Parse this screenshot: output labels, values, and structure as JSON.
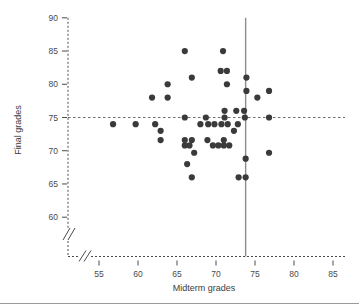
{
  "chart_data": {
    "type": "scatter",
    "title": "",
    "xlabel": "Midterm grades",
    "ylabel": "Final grades",
    "xlim": [
      52,
      87
    ],
    "ylim": [
      57.5,
      91
    ],
    "xticks": [
      55,
      60,
      65,
      70,
      75,
      80,
      85
    ],
    "xtick_labels": [
      "55",
      "60",
      "65",
      "70",
      "75",
      "80",
      "85"
    ],
    "yticks": [
      60,
      65,
      70,
      75,
      80,
      85,
      90
    ],
    "ytick_labels": [
      "60",
      "65",
      "70",
      "75",
      "80",
      "85",
      "90"
    ],
    "grid": false,
    "legend": null,
    "axis_break_x": true,
    "axis_break_y": true,
    "reference_lines": [
      {
        "orientation": "horizontal",
        "value": 75,
        "style": "dashed",
        "color": "#6e6e6e"
      },
      {
        "orientation": "vertical",
        "value": 73.8,
        "style": "solid",
        "color": "#8c8c8c"
      }
    ],
    "marker": {
      "shape": "circle",
      "color": "#3a3a3a",
      "size": 3.1
    },
    "points": [
      {
        "x": 56.8,
        "y": 74.0
      },
      {
        "x": 59.7,
        "y": 74.0
      },
      {
        "x": 62.2,
        "y": 74.0
      },
      {
        "x": 61.8,
        "y": 78.0
      },
      {
        "x": 62.9,
        "y": 73.0
      },
      {
        "x": 62.9,
        "y": 71.6
      },
      {
        "x": 63.8,
        "y": 78.0
      },
      {
        "x": 63.8,
        "y": 80.0
      },
      {
        "x": 66.0,
        "y": 85.0
      },
      {
        "x": 66.9,
        "y": 81.0
      },
      {
        "x": 66.0,
        "y": 75.0
      },
      {
        "x": 66.0,
        "y": 71.6
      },
      {
        "x": 66.0,
        "y": 70.8
      },
      {
        "x": 66.6,
        "y": 70.8
      },
      {
        "x": 66.9,
        "y": 71.6
      },
      {
        "x": 67.2,
        "y": 69.7
      },
      {
        "x": 66.3,
        "y": 68.0
      },
      {
        "x": 66.9,
        "y": 66.0
      },
      {
        "x": 68.0,
        "y": 74.0
      },
      {
        "x": 68.7,
        "y": 75.0
      },
      {
        "x": 69.0,
        "y": 74.0
      },
      {
        "x": 69.8,
        "y": 74.0
      },
      {
        "x": 68.9,
        "y": 71.6
      },
      {
        "x": 69.6,
        "y": 70.8
      },
      {
        "x": 70.3,
        "y": 70.8
      },
      {
        "x": 70.6,
        "y": 82.0
      },
      {
        "x": 70.9,
        "y": 85.0
      },
      {
        "x": 71.4,
        "y": 82.0
      },
      {
        "x": 71.4,
        "y": 80.0
      },
      {
        "x": 71.1,
        "y": 76.0
      },
      {
        "x": 71.1,
        "y": 75.0
      },
      {
        "x": 70.7,
        "y": 74.0
      },
      {
        "x": 71.5,
        "y": 74.0
      },
      {
        "x": 71.0,
        "y": 71.6
      },
      {
        "x": 71.0,
        "y": 70.8
      },
      {
        "x": 71.7,
        "y": 70.8
      },
      {
        "x": 72.3,
        "y": 73.0
      },
      {
        "x": 72.6,
        "y": 76.0
      },
      {
        "x": 72.8,
        "y": 74.0
      },
      {
        "x": 72.9,
        "y": 66.0
      },
      {
        "x": 73.8,
        "y": 66.0
      },
      {
        "x": 73.8,
        "y": 68.8
      },
      {
        "x": 73.7,
        "y": 75.0
      },
      {
        "x": 73.6,
        "y": 76.0
      },
      {
        "x": 73.9,
        "y": 79.0
      },
      {
        "x": 73.9,
        "y": 81.0
      },
      {
        "x": 75.3,
        "y": 78.0
      },
      {
        "x": 76.8,
        "y": 79.0
      },
      {
        "x": 76.8,
        "y": 75.0
      },
      {
        "x": 76.8,
        "y": 69.7
      }
    ]
  }
}
